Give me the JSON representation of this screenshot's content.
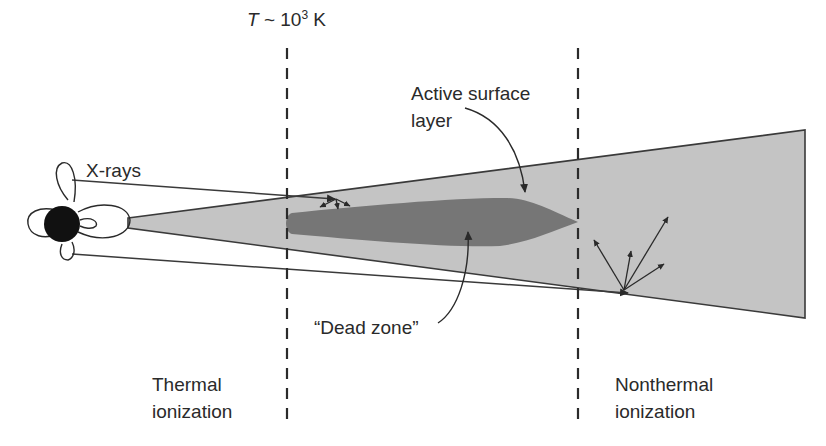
{
  "diagram": {
    "labels": {
      "temperature": {
        "symbol": "T",
        "rest": " ~ 10",
        "exp": "3",
        "unit": " K"
      },
      "xrays": "X-rays",
      "active_line1": "Active surface",
      "active_line2": "layer",
      "dead_zone": "“Dead zone”",
      "thermal_line1": "Thermal",
      "thermal_line2": "ionization",
      "nonthermal_line1": "Nonthermal",
      "nonthermal_line2": "ionization"
    },
    "colors": {
      "disk_fill": "#c4c4c4",
      "dead_zone_fill": "#767676",
      "line": "#3a3a3a",
      "star": "#111111"
    }
  }
}
